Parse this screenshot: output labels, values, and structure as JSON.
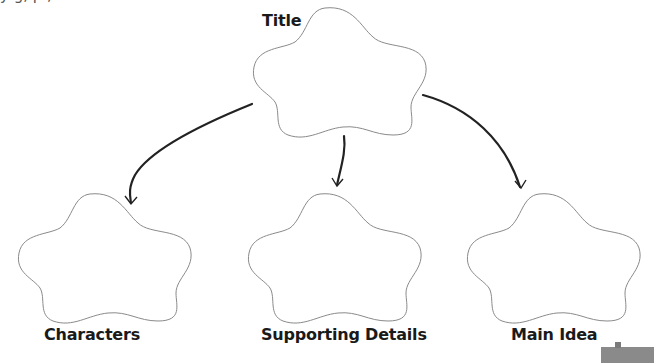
{
  "diagram": {
    "top_partial_text": "y                    g,          p                    ,",
    "nodes": [
      {
        "id": "title",
        "label": "Title",
        "x": 253,
        "y": 7,
        "label_x": 262,
        "label_y": 12,
        "font_size": 16
      },
      {
        "id": "characters",
        "label": "Characters",
        "x": 18,
        "y": 193,
        "label_x": 44,
        "label_y": 326,
        "font_size": 16
      },
      {
        "id": "supporting-details",
        "label": "Supporting Details",
        "x": 248,
        "y": 193,
        "label_x": 261,
        "label_y": 326,
        "font_size": 16
      },
      {
        "id": "main-idea",
        "label": "Main Idea",
        "x": 467,
        "y": 193,
        "label_x": 511,
        "label_y": 326,
        "font_size": 16
      }
    ],
    "edges": [
      {
        "from": "title",
        "to": "characters",
        "path": "M252,104 C200,125 150,150 135,175 C128,188 130,196 131,203"
      },
      {
        "from": "title",
        "to": "supporting-details",
        "path": "M344,136 C346,150 342,163 337,185"
      },
      {
        "from": "title",
        "to": "main-idea",
        "path": "M423,95 C470,108 505,140 520,187"
      }
    ],
    "colors": {
      "cloud_stroke": "#8a8a8a",
      "arrow": "#222222",
      "label": "#1a1a1a",
      "corner_widget": "#8a8a8a"
    }
  }
}
